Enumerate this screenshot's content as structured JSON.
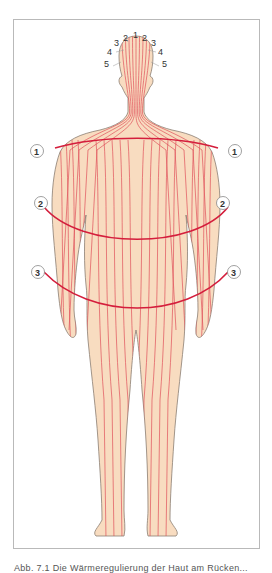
{
  "figure": {
    "skin_color": "#f8dcc0",
    "outline_color": "#8a7d72",
    "line_color": "#e0505a",
    "band_color": "#d41e3c",
    "head_labels": [
      "5",
      "4",
      "3",
      "2",
      "1",
      "2",
      "3",
      "4",
      "5"
    ],
    "markers": [
      {
        "label": "1"
      },
      {
        "label": "1"
      },
      {
        "label": "2"
      },
      {
        "label": "2"
      },
      {
        "label": "3"
      },
      {
        "label": "3"
      }
    ],
    "caption": "Abb. 7.1 Die Wärmeregulierung der Haut am Rücken..."
  }
}
